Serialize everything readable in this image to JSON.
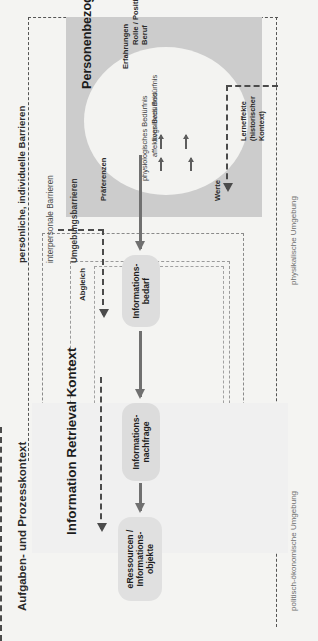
{
  "figure": {
    "title_main": "Information Retrieval Kontext",
    "orientation": "rotated-90-ccw",
    "colors": {
      "page_background": "#f4f4f2",
      "ir_panel": "#f0f0f0",
      "person_panel": "#cccccc",
      "ellipse": "#f3f3f1",
      "node": "#e0e0e0",
      "solid_arrow": "#707070",
      "dashed_line": "#4b4b4b",
      "text": "#1c1c1c"
    }
  },
  "context_labels": {
    "task_process": "Aufgaben- und Prozesskontext",
    "personal_barriers": "persönliche, individuelle Barrieren",
    "interpersonal_barriers": "interpersonale Barrieren",
    "environment_barriers": "Umgebungsbarrieren",
    "physical_environment": "physikalische Umgebung",
    "political_economic_environment": "politisch-ökonomische Umgebung"
  },
  "ir_context": {
    "title": "Information Retrieval Kontext",
    "nodes": {
      "eresources": "eRessourcen /\nInformations-\nobjekte",
      "demand": "Informations-\nnachfrage"
    }
  },
  "person_context": {
    "title": "Personenbezog. Kontext",
    "attributes": {
      "role": "Rolle / Position /\nBeruf",
      "experience": "Erfahrungen",
      "preferences": "Präferenzen",
      "values": "Werte"
    },
    "needs": {
      "cognitive": "kognitives Bedürfnis",
      "affective": "affektives Bedürfnis",
      "physiological": "physiologisches Bedürfnis"
    }
  },
  "bridge": {
    "need_node": "Informations-\nbedarf",
    "matching_label": "Abgleich",
    "learning_label": "Lerneffekte\n(historischer\nKontext)"
  }
}
